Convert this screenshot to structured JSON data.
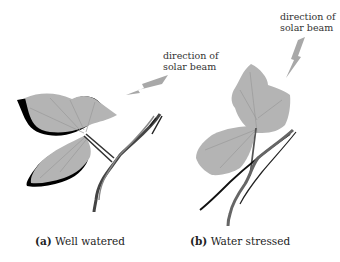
{
  "panels": [
    {
      "id": "a",
      "caption_letter": "(a)",
      "caption_text": "Well watered",
      "arrow_label_line1": "direction of",
      "arrow_label_line2": "solar beam",
      "leaf_shadow": true
    },
    {
      "id": "b",
      "caption_letter": "(b)",
      "caption_text": "Water stressed",
      "arrow_label_line1": "direction of",
      "arrow_label_line2": "solar beam",
      "leaf_shadow": false
    }
  ],
  "colors": {
    "leaf": "#b4b4b4",
    "leaf_vein": "#9a9a9a",
    "shadow": "#000000",
    "arrow": "#a8a8a8",
    "stem": "#555555"
  }
}
